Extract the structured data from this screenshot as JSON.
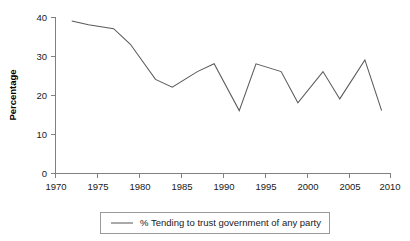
{
  "chart_data": {
    "type": "line",
    "title": "",
    "xlabel": "",
    "ylabel": "Percentage",
    "xlim": [
      1970,
      2010
    ],
    "ylim": [
      0,
      40
    ],
    "grid": false,
    "legend_position": "bottom",
    "x_ticks": [
      "1970",
      "1975",
      "1980",
      "1985",
      "1990",
      "1995",
      "2000",
      "2005",
      "2010"
    ],
    "x_tick_values": [
      1970,
      1975,
      1980,
      1985,
      1990,
      1995,
      2000,
      2005,
      2010
    ],
    "y_ticks": [
      "0",
      "10",
      "20",
      "30",
      "40"
    ],
    "y_tick_values": [
      0,
      10,
      20,
      30,
      40
    ],
    "series": [
      {
        "name": "% Tending to trust government of any party",
        "color": "#5a5a5a",
        "x": [
          1972,
          1974,
          1977,
          1979,
          1982,
          1984,
          1987,
          1989,
          1992,
          1994,
          1997,
          1999,
          2002,
          2004,
          2007,
          2009
        ],
        "values": [
          39,
          38,
          37,
          33,
          24,
          22,
          26,
          28,
          16,
          28,
          26,
          18,
          26,
          19,
          29,
          16
        ]
      }
    ]
  },
  "legend": {
    "entries": [
      {
        "label": "% Tending to trust government of any party"
      }
    ]
  },
  "axes": {
    "y_title": "Percentage"
  }
}
